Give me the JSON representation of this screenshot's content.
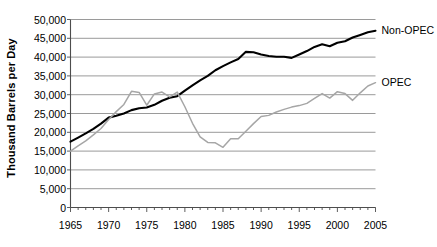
{
  "chart_data": {
    "type": "line",
    "title": "",
    "xlabel": "",
    "ylabel": "Thousand Barrels per Day",
    "xlim": [
      1965,
      2005
    ],
    "ylim": [
      0,
      50000
    ],
    "xticks": [
      1965,
      1970,
      1975,
      1980,
      1985,
      1990,
      1995,
      2000,
      2005
    ],
    "xtick_labels": [
      "1965",
      "1970",
      "1975",
      "1980",
      "1985",
      "1990",
      "1995",
      "2000",
      "2005"
    ],
    "yticks": [
      0,
      5000,
      10000,
      15000,
      20000,
      25000,
      30000,
      35000,
      40000,
      45000,
      50000
    ],
    "ytick_labels": [
      "0",
      "5,000",
      "10,000",
      "15,000",
      "20,000",
      "25,000",
      "30,000",
      "35,000",
      "40,000",
      "45,000",
      "50,000"
    ],
    "grid": true,
    "grid_axis": "y",
    "legend_position": "inline-right",
    "x": [
      1965,
      1966,
      1967,
      1968,
      1969,
      1970,
      1971,
      1972,
      1973,
      1974,
      1975,
      1976,
      1977,
      1978,
      1979,
      1980,
      1981,
      1982,
      1983,
      1984,
      1985,
      1986,
      1987,
      1988,
      1989,
      1990,
      1991,
      1992,
      1993,
      1994,
      1995,
      1996,
      1997,
      1998,
      1999,
      2000,
      2001,
      2002,
      2003,
      2004,
      2005
    ],
    "series": [
      {
        "name": "Non-OPEC",
        "color": "#000000",
        "label_x": 2005,
        "label_y": 47000,
        "values": [
          17500,
          18600,
          19700,
          20900,
          22300,
          23900,
          24400,
          25000,
          25900,
          26400,
          26600,
          27300,
          28400,
          29200,
          29600,
          31100,
          32500,
          33800,
          35000,
          36500,
          37600,
          38600,
          39500,
          41400,
          41300,
          40700,
          40300,
          40100,
          40100,
          39800,
          40700,
          41600,
          42700,
          43400,
          42900,
          43800,
          44200,
          45200,
          45900,
          46600,
          47000
        ]
      },
      {
        "name": "OPEC",
        "color": "#a6a6a6",
        "label_x": 2005,
        "label_y": 33000,
        "values": [
          15000,
          16400,
          17700,
          19300,
          21000,
          23400,
          25500,
          27400,
          30900,
          30600,
          27200,
          30200,
          30700,
          29400,
          30700,
          26800,
          22400,
          18800,
          17300,
          17200,
          16000,
          18300,
          18300,
          20300,
          22300,
          24200,
          24500,
          25400,
          26100,
          26700,
          27100,
          27700,
          29000,
          30300,
          29100,
          30800,
          30300,
          28500,
          30500,
          32300,
          33200
        ]
      }
    ]
  }
}
